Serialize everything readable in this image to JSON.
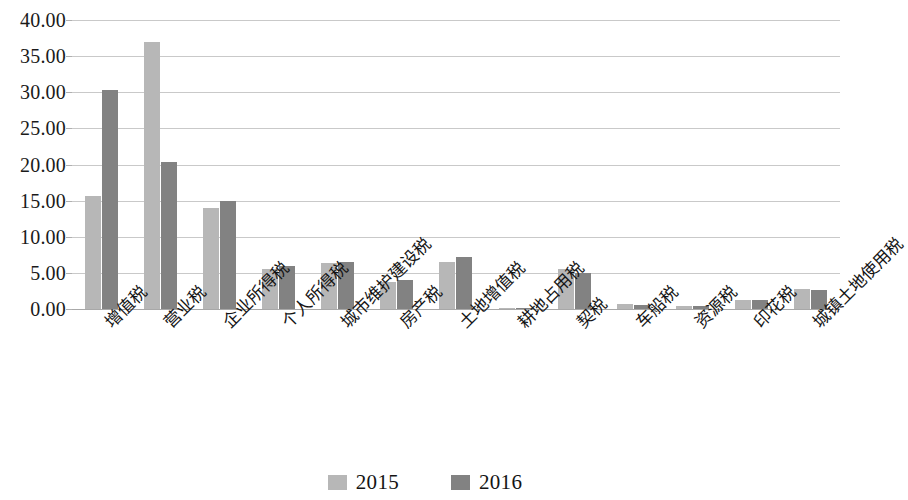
{
  "chart_data": {
    "type": "bar",
    "title": "",
    "subtitle": "",
    "xlabel": "",
    "ylabel": "",
    "ylim": [
      0,
      40
    ],
    "ytick_step": 5,
    "ytick_labels": [
      "0.00",
      "5.00",
      "10.00",
      "15.00",
      "20.00",
      "25.00",
      "30.00",
      "35.00",
      "40.00"
    ],
    "grid": true,
    "legend_position": "bottom-center",
    "categories": [
      "增值税",
      "营业税",
      "企业所得税",
      "个人所得税",
      "城市维护建设税",
      "房产税",
      "土地增值税",
      "耕地占用税",
      "契税",
      "车船税",
      "资源税",
      "印花税",
      "城镇土地使用税"
    ],
    "series": [
      {
        "name": "2015",
        "color": "#b7b7b7",
        "values": [
          15.7,
          37.0,
          14.0,
          5.6,
          6.4,
          3.8,
          6.5,
          0.2,
          5.6,
          0.7,
          0.4,
          1.3,
          2.8
        ]
      },
      {
        "name": "2016",
        "color": "#828282",
        "values": [
          30.3,
          20.3,
          14.9,
          5.9,
          6.5,
          4.0,
          7.2,
          0.2,
          5.0,
          0.6,
          0.4,
          1.3,
          2.6
        ]
      }
    ]
  },
  "legend": {
    "items": [
      {
        "label": "2015",
        "color": "#b7b7b7"
      },
      {
        "label": "2016",
        "color": "#828282"
      }
    ]
  }
}
